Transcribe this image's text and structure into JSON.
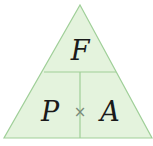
{
  "diagram": {
    "type": "formula-triangle",
    "top": "F",
    "bottom_left": "P",
    "bottom_right": "A",
    "operator": "×",
    "colors": {
      "fill": "#e4f3dd",
      "stroke": "#9fcf98",
      "text": "#1a1a1a",
      "operator": "#7a8a7a"
    }
  }
}
